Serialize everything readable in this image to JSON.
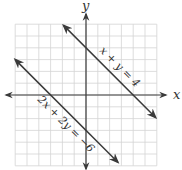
{
  "chart_data": {
    "type": "line",
    "title": "",
    "xlabel": "x",
    "ylabel": "y",
    "xlim": [
      -6,
      6
    ],
    "ylim": [
      -6,
      6
    ],
    "grid": true,
    "grid_step": 1,
    "tick_labels": false,
    "series": [
      {
        "name": "x + y = 4",
        "equation": "x + y = 4",
        "x": [
          -1.9,
          5.9
        ],
        "y": [
          5.9,
          -1.9
        ],
        "x_intercept": 4,
        "y_intercept": 4,
        "arrows": "both"
      },
      {
        "name": "2x + 2y = −6",
        "equation": "2x + 2y = −6",
        "x": [
          -6.0,
          2.7
        ],
        "y": [
          3.0,
          -5.7
        ],
        "x_intercept": -3,
        "y_intercept": -3,
        "arrows": "both"
      }
    ],
    "annotations": [
      "x + y = 4",
      "2x + 2y = −6"
    ]
  },
  "axes": {
    "x_label": "x",
    "y_label": "y"
  },
  "labels": {
    "line1": "x + y = 4",
    "line2": "2x + 2y = −6"
  },
  "colors": {
    "grid": "#d4d4d4",
    "axis": "#3a3a3a",
    "line": "#3a3a3a",
    "text": "#333333"
  }
}
